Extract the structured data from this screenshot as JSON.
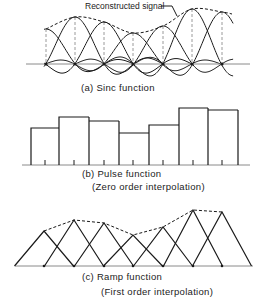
{
  "figure": {
    "annotation": "Reconstructed signal",
    "panels": [
      {
        "id": "a",
        "caption": [
          "(a) Sinc function"
        ],
        "type": "sinc",
        "baseline_y": 64,
        "axis_x": [
          26,
          250
        ],
        "spacing": 29.3,
        "samples": [
          {
            "x": 46,
            "y": 29
          },
          {
            "x": 75,
            "y": 17
          },
          {
            "x": 104,
            "y": 22
          },
          {
            "x": 133,
            "y": 33
          },
          {
            "x": 163,
            "y": 26
          },
          {
            "x": 192,
            "y": 9
          },
          {
            "x": 222,
            "y": 12
          }
        ]
      },
      {
        "id": "b",
        "caption": [
          "(b) Pulse function",
          "(Zero order interpolation)"
        ],
        "type": "pulse",
        "baseline_y": 165,
        "axis_x": [
          22,
          250
        ],
        "bars": [
          {
            "x0": 31,
            "x1": 59,
            "top": 128,
            "tick": 45
          },
          {
            "x0": 59,
            "x1": 89,
            "top": 117,
            "tick": 74
          },
          {
            "x0": 89,
            "x1": 119,
            "top": 121,
            "tick": 104
          },
          {
            "x0": 119,
            "x1": 149,
            "top": 133,
            "tick": 133
          },
          {
            "x0": 149,
            "x1": 179,
            "top": 125,
            "tick": 163
          },
          {
            "x0": 179,
            "x1": 208,
            "top": 108,
            "tick": 193
          },
          {
            "x0": 208,
            "x1": 238,
            "top": 110,
            "tick": 222
          }
        ]
      },
      {
        "id": "c",
        "caption": [
          "(c) Ramp function",
          "(First order interpolation)"
        ],
        "type": "ramp",
        "baseline_y": 266,
        "axis_x": [
          15,
          253
        ],
        "half_width": 29.5,
        "samples": [
          {
            "x": 44,
            "y": 231
          },
          {
            "x": 74,
            "y": 220
          },
          {
            "x": 104,
            "y": 223
          },
          {
            "x": 133,
            "y": 235
          },
          {
            "x": 163,
            "y": 227
          },
          {
            "x": 193,
            "y": 210
          },
          {
            "x": 222,
            "y": 212
          }
        ]
      }
    ]
  }
}
